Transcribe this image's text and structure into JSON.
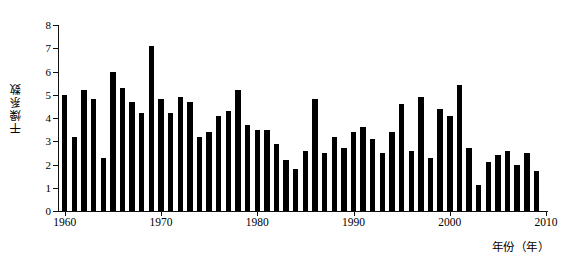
{
  "chart_data": {
    "type": "bar",
    "title": "",
    "xlabel": "年份（年）",
    "ylabel": "干燥系数",
    "xlim": [
      1959.3,
      2010.2
    ],
    "ylim": [
      0,
      8
    ],
    "grid": false,
    "legend": null,
    "bar_color": "#000000",
    "background_color": "#ffffff",
    "ytick_labels": [
      "0",
      "1",
      "2",
      "3",
      "4",
      "5",
      "6",
      "7",
      "8"
    ],
    "ytick_values": [
      0,
      1,
      2,
      3,
      4,
      5,
      6,
      7,
      8
    ],
    "xtick_labels": [
      "1960",
      "1970",
      "1980",
      "1990",
      "2000",
      "2010"
    ],
    "xtick_values": [
      1960,
      1970,
      1980,
      1990,
      2000,
      2010
    ],
    "categories": [
      1960,
      1961,
      1962,
      1963,
      1964,
      1965,
      1966,
      1967,
      1968,
      1969,
      1970,
      1971,
      1972,
      1973,
      1974,
      1975,
      1976,
      1977,
      1978,
      1979,
      1980,
      1981,
      1982,
      1983,
      1984,
      1985,
      1986,
      1987,
      1988,
      1989,
      1990,
      1991,
      1992,
      1993,
      1994,
      1995,
      1996,
      1997,
      1998,
      1999,
      2000,
      2001,
      2002,
      2003,
      2004,
      2005,
      2006,
      2007,
      2008,
      2009
    ],
    "values": [
      5.0,
      3.2,
      5.2,
      4.8,
      2.3,
      6.0,
      5.3,
      4.7,
      4.2,
      7.1,
      4.8,
      4.2,
      4.9,
      4.7,
      3.2,
      3.4,
      4.1,
      4.3,
      5.2,
      3.7,
      3.5,
      3.5,
      2.9,
      2.2,
      1.8,
      2.6,
      4.8,
      2.5,
      3.2,
      2.7,
      3.4,
      3.6,
      3.1,
      2.5,
      3.4,
      4.6,
      2.6,
      4.9,
      2.3,
      4.4,
      4.1,
      5.4,
      2.7,
      1.1,
      2.1,
      2.4,
      2.6,
      2.0,
      2.5,
      1.7
    ]
  }
}
